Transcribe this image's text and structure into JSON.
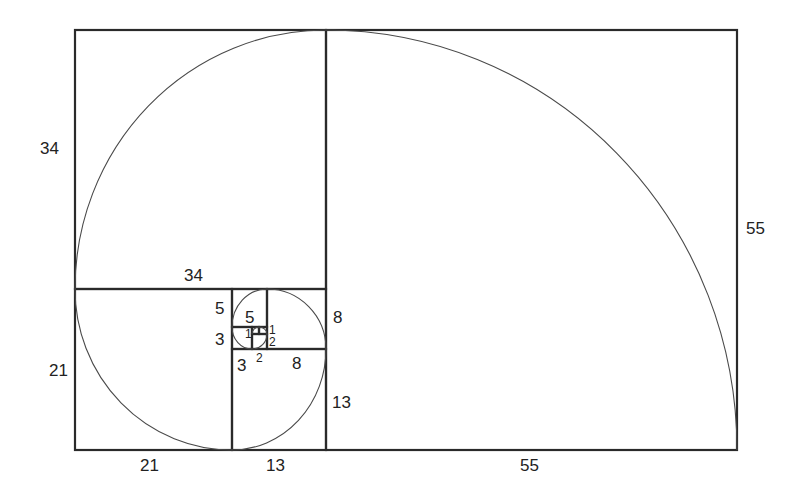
{
  "diagram": {
    "stroke_color": "#2a2a2a",
    "curve_color": "#4a4a4a",
    "labels": {
      "square_34_side": "34",
      "square_34_top": "34",
      "square_21_side": "21",
      "square_21_bottom": "21",
      "square_13_side": "13",
      "square_13_bottom": "13",
      "square_55_side": "55",
      "square_55_bottom": "55",
      "square_8_side": "8",
      "square_8_bottom": "8",
      "square_5_side": "5",
      "square_5_inner": "5",
      "square_3_side": "3",
      "square_3_bottom": "3",
      "square_2_side": "2",
      "square_2_bottom": "2",
      "square_1_left": "1",
      "square_1_right": "1"
    },
    "squares": [
      {
        "size": 55,
        "x": 326,
        "y": 30,
        "w": 411,
        "h": 420
      },
      {
        "size": 34,
        "x": 75,
        "y": 30,
        "w": 251,
        "h": 259
      },
      {
        "size": 21,
        "x": 75,
        "y": 289,
        "w": 157,
        "h": 161
      },
      {
        "size": 13,
        "x": 232,
        "y": 349,
        "w": 94,
        "h": 101
      },
      {
        "size": 8,
        "x": 267,
        "y": 289,
        "w": 59,
        "h": 60
      },
      {
        "size": 5,
        "x": 232,
        "y": 289,
        "w": 35,
        "h": 38
      },
      {
        "size": 3,
        "x": 232,
        "y": 327,
        "w": 20,
        "h": 22
      },
      {
        "size": 2,
        "x": 252,
        "y": 334,
        "w": 15,
        "h": 15
      },
      {
        "size": 1,
        "x": 252,
        "y": 327,
        "w": 7,
        "h": 7
      },
      {
        "size": 1,
        "x": 259,
        "y": 327,
        "w": 8,
        "h": 7
      }
    ]
  }
}
